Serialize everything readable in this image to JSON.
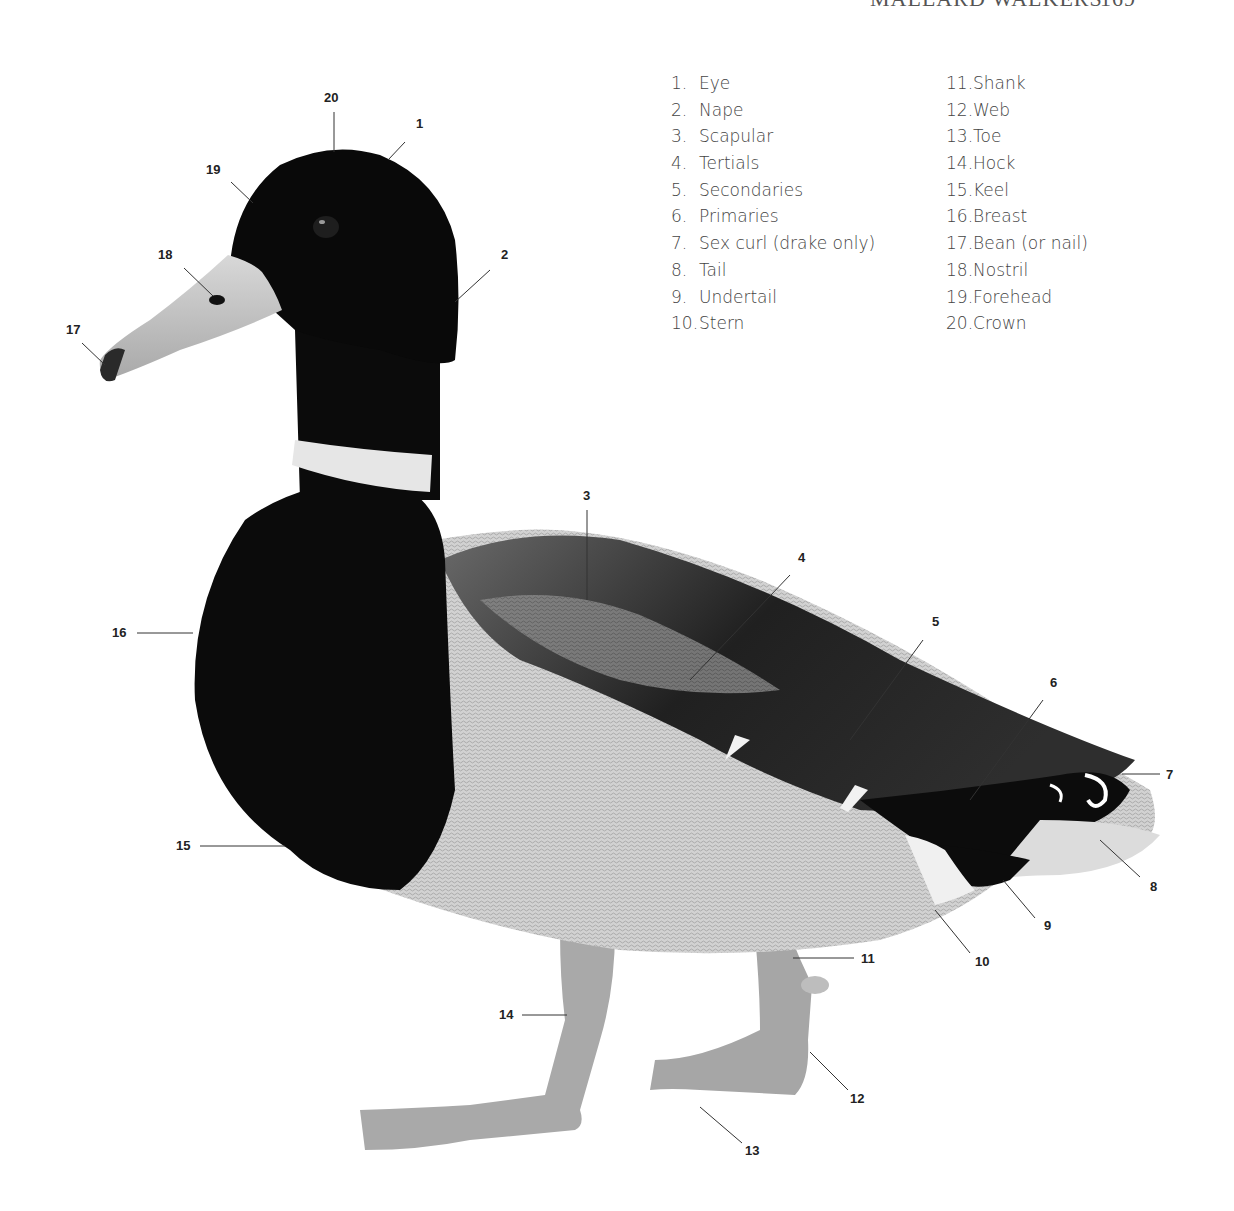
{
  "running_head": {
    "section": "MALLARD WALKERS",
    "page": "169"
  },
  "diagram": {
    "legend": [
      {
        "num": "1.",
        "label": "Eye"
      },
      {
        "num": "2.",
        "label": "Nape"
      },
      {
        "num": "3.",
        "label": "Scapular"
      },
      {
        "num": "4.",
        "label": "Tertials"
      },
      {
        "num": "5.",
        "label": "Secondaries"
      },
      {
        "num": "6.",
        "label": "Primaries"
      },
      {
        "num": "7.",
        "label": "Sex curl (drake only)"
      },
      {
        "num": "8.",
        "label": "Tail"
      },
      {
        "num": "9.",
        "label": "Undertail"
      },
      {
        "num": "10.",
        "label": "Stern"
      },
      {
        "num": "11.",
        "label": "Shank"
      },
      {
        "num": "12.",
        "label": "Web"
      },
      {
        "num": "13.",
        "label": "Toe"
      },
      {
        "num": "14.",
        "label": "Hock"
      },
      {
        "num": "15.",
        "label": "Keel"
      },
      {
        "num": "16.",
        "label": "Breast"
      },
      {
        "num": "17.",
        "label": "Bean (or nail)"
      },
      {
        "num": "18.",
        "label": "Nostril"
      },
      {
        "num": "19.",
        "label": "Forehead"
      },
      {
        "num": "20.",
        "label": "Crown"
      }
    ],
    "callouts": [
      {
        "id": "1",
        "text": "1",
        "x": 421,
        "y": 128
      },
      {
        "id": "2",
        "text": "2",
        "x": 506,
        "y": 259
      },
      {
        "id": "3",
        "text": "3",
        "x": 587,
        "y": 500
      },
      {
        "id": "4",
        "text": "4",
        "x": 803,
        "y": 562
      },
      {
        "id": "5",
        "text": "5",
        "x": 937,
        "y": 626
      },
      {
        "id": "6",
        "text": "6",
        "x": 1055,
        "y": 687
      },
      {
        "id": "7",
        "text": "7",
        "x": 1171,
        "y": 778
      },
      {
        "id": "8",
        "text": "8",
        "x": 1155,
        "y": 891
      },
      {
        "id": "9",
        "text": "9",
        "x": 1048,
        "y": 930
      },
      {
        "id": "10",
        "text": "10",
        "x": 983,
        "y": 966
      },
      {
        "id": "11",
        "text": "11",
        "x": 870,
        "y": 963
      },
      {
        "id": "12",
        "text": "12",
        "x": 858,
        "y": 1103
      },
      {
        "id": "13",
        "text": "13",
        "x": 753,
        "y": 1155
      },
      {
        "id": "14",
        "text": "14",
        "x": 508,
        "y": 1019
      },
      {
        "id": "15",
        "text": "15",
        "x": 184,
        "y": 849
      },
      {
        "id": "16",
        "text": "16",
        "x": 121,
        "y": 637
      },
      {
        "id": "17",
        "text": "17",
        "x": 74,
        "y": 334
      },
      {
        "id": "18",
        "text": "18",
        "x": 166,
        "y": 259
      },
      {
        "id": "19",
        "text": "19",
        "x": 214,
        "y": 174
      },
      {
        "id": "20",
        "text": "20",
        "x": 332,
        "y": 102
      }
    ],
    "colors": {
      "plumage_dark": "#0a0a0a",
      "collar": "#e8e8e8",
      "bill": "#bdbdbd",
      "body": "#cfcfcf",
      "wing": "#3a3a3a",
      "feet": "#a8a8a8",
      "legend_text": "#444444",
      "callout_text": "#222222"
    }
  }
}
